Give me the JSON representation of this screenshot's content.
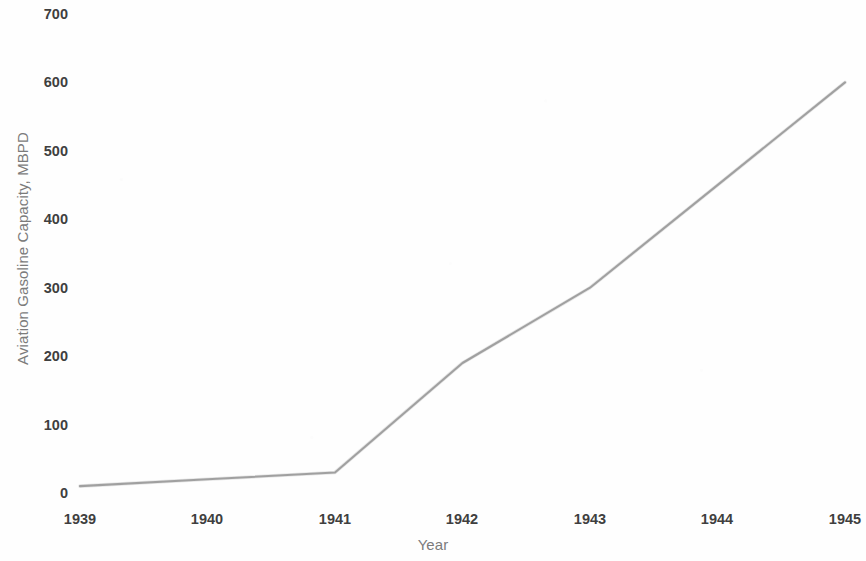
{
  "chart_data": {
    "type": "line",
    "title": "",
    "subtitle": "",
    "xlabel": "Year",
    "ylabel": "Aviation Gasoline Capacity, MBPD",
    "x": [
      1939,
      1940,
      1941,
      1942,
      1943,
      1944,
      1945
    ],
    "categories": [
      "1939",
      "1940",
      "1941",
      "1942",
      "1943",
      "1944",
      "1945"
    ],
    "values": [
      10,
      20,
      30,
      190,
      300,
      450,
      600
    ],
    "series": [
      {
        "name": "Aviation Gasoline Capacity",
        "values": [
          10,
          20,
          30,
          190,
          300,
          450,
          600
        ]
      }
    ],
    "xlim": [
      1939,
      1945
    ],
    "ylim": [
      0,
      700
    ],
    "ytick_labels": [
      "0",
      "100",
      "200",
      "300",
      "400",
      "500",
      "600",
      "700"
    ],
    "ytick_values": [
      0,
      100,
      200,
      300,
      400,
      500,
      600,
      700
    ],
    "xtick_labels": [
      "1939",
      "1940",
      "1941",
      "1942",
      "1943",
      "1944",
      "1945"
    ],
    "grid": false,
    "legend": false,
    "legend_position": "none",
    "line_color": "#9a9a9a",
    "tick_label_color": "#3f3f3f",
    "axis_title_color": "#7b7b7b",
    "background_color": "#ffffff",
    "annotations": []
  }
}
